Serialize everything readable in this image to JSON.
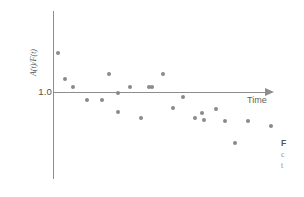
{
  "figure": {
    "name": "scatter-figure"
  },
  "axes": {
    "x_label": "Time",
    "y_label": "A(t)/F(t)",
    "y_tick_label": "1.0"
  },
  "caption": {
    "line1": "F",
    "line2": "c",
    "line3": "t"
  },
  "colors": {
    "axis": "#8d8d8d",
    "dot": "#8a8a8a",
    "text": "#5f5f5f",
    "background": "#ffffff"
  },
  "chart_data": {
    "type": "scatter",
    "title": "",
    "xlabel": "Time",
    "ylabel": "A(t)/F(t)",
    "grid": false,
    "legend": null,
    "reference_line": {
      "axis": "y",
      "value": 1.0,
      "label": "1.0"
    },
    "ytick_values": [
      1.0
    ],
    "ytick_labels": [
      "1.0"
    ],
    "xtick_labels": [],
    "xlim": [
      0,
      24
    ],
    "ylim": [
      0.55,
      1.55
    ],
    "points": [
      {
        "x": 1,
        "y": 1.42
      },
      {
        "x": 2,
        "y": 1.11
      },
      {
        "x": 3,
        "y": 1.05
      },
      {
        "x": 4,
        "y": 0.87
      },
      {
        "x": 5,
        "y": 0.81
      },
      {
        "x": 6,
        "y": 1.18
      },
      {
        "x": 7,
        "y": 0.96
      },
      {
        "x": 8,
        "y": 0.83
      },
      {
        "x": 9,
        "y": 1.05
      },
      {
        "x": 10,
        "y": 0.76
      },
      {
        "x": 11,
        "y": 1.05
      },
      {
        "x": 12,
        "y": 1.19
      },
      {
        "x": 13,
        "y": 0.83
      },
      {
        "x": 14,
        "y": 0.95
      },
      {
        "x": 15,
        "y": 0.76
      },
      {
        "x": 16,
        "y": 0.79
      },
      {
        "x": 17,
        "y": 0.85
      },
      {
        "x": 18,
        "y": 0.76
      },
      {
        "x": 19,
        "y": 0.62
      },
      {
        "x": 20,
        "y": 0.76
      },
      {
        "x": 21,
        "y": 0.71
      }
    ],
    "pixel_points": [
      {
        "x": 58,
        "y": 53
      },
      {
        "x": 65,
        "y": 79
      },
      {
        "x": 73,
        "y": 87
      },
      {
        "x": 87,
        "y": 100
      },
      {
        "x": 102,
        "y": 100
      },
      {
        "x": 109,
        "y": 74
      },
      {
        "x": 118,
        "y": 93
      },
      {
        "x": 118,
        "y": 112
      },
      {
        "x": 130,
        "y": 87
      },
      {
        "x": 141,
        "y": 118
      },
      {
        "x": 149,
        "y": 87
      },
      {
        "x": 163,
        "y": 74
      },
      {
        "x": 152,
        "y": 87
      },
      {
        "x": 183,
        "y": 97
      },
      {
        "x": 173,
        "y": 108
      },
      {
        "x": 195,
        "y": 118
      },
      {
        "x": 202,
        "y": 113
      },
      {
        "x": 216,
        "y": 109
      },
      {
        "x": 204,
        "y": 120
      },
      {
        "x": 225,
        "y": 121
      },
      {
        "x": 248,
        "y": 121
      },
      {
        "x": 271,
        "y": 126
      },
      {
        "x": 235,
        "y": 143
      }
    ]
  }
}
